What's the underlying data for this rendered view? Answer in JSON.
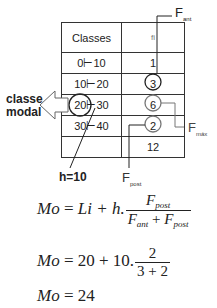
{
  "table": {
    "headers": [
      "Classes",
      "fi"
    ],
    "rows": [
      {
        "classe": "0⊢10",
        "fi": "1"
      },
      {
        "classe": "10⊢20",
        "fi": "3"
      },
      {
        "classe": "20⊢30",
        "fi": "6"
      },
      {
        "classe": "30⊢40",
        "fi": "2"
      },
      {
        "classe": "",
        "fi": "12"
      }
    ]
  },
  "annotations": {
    "modal_line1": "classe",
    "modal_line2": "modal",
    "h": "h=10",
    "f_ant": "F",
    "f_ant_sub": "ant",
    "f_max": "F",
    "f_max_sub": "máx",
    "f_post": "F",
    "f_post_sub": "post"
  },
  "formulas": {
    "general": {
      "lhs": "Mo",
      "eq": "=",
      "rhs": "Li + h.",
      "num": "F",
      "num_sub": "post",
      "den_a": "F",
      "den_a_sub": "ant",
      "den_plus": "+",
      "den_b": "F",
      "den_b_sub": "post"
    },
    "substituted": {
      "lhs": "Mo",
      "eq": "=",
      "rhs": "20 + 10.",
      "num": "2",
      "den": "3 + 2"
    },
    "result": {
      "lhs": "Mo",
      "eq": "=",
      "rhs": "24"
    }
  }
}
